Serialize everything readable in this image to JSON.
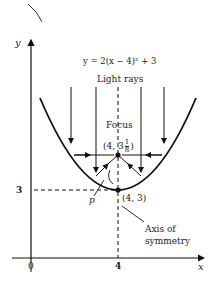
{
  "diagram": {
    "equation": "y = 2(x − 4)² + 3",
    "light_rays_label": "Light rays",
    "focus_label": "Focus",
    "focus_coords": "(4, 3",
    "focus_frac_num": "1",
    "focus_frac_den": "8",
    "focus_close": ")",
    "vertex_coords": "(4, 3)",
    "point_label": "p",
    "axis_label_line1": "Axis of",
    "axis_label_line2": "symmetry",
    "y_axis_label": "y",
    "x_axis_label": "x",
    "y_tick_3": "3",
    "x_tick_0": "0",
    "x_tick_4": "4"
  }
}
